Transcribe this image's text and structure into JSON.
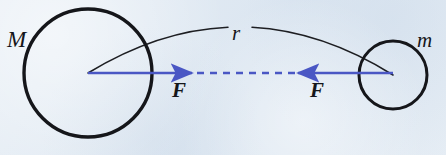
{
  "figure": {
    "kind": "physics-force-diagram",
    "width": 446,
    "height": 155,
    "background_color": "#dde7f1"
  },
  "colors": {
    "background": "#dde7f1",
    "ink": "#15161a",
    "force_arrow": "#4a57c4",
    "arc": "#1d1e22"
  },
  "bodies": [
    {
      "id": "large-mass",
      "label": "M",
      "label_x": 7,
      "label_y": 28,
      "center_x": 88,
      "center_y": 73,
      "radius": 64,
      "stroke_width": 3.4
    },
    {
      "id": "small-mass",
      "label": "m",
      "label_x": 417,
      "label_y": 30,
      "center_x": 393,
      "center_y": 75,
      "radius": 34,
      "stroke_width": 3.0
    }
  ],
  "separation": {
    "id": "separation-arc",
    "label": "r",
    "label_x": 232,
    "label_y": 23,
    "from_x": 88,
    "from_y": 73,
    "to_x": 393,
    "to_y": 75,
    "apex_y": 27,
    "stroke_width": 1.5,
    "gap_start_x": 228,
    "gap_end_x": 252
  },
  "forces": [
    {
      "id": "force-on-M",
      "label": "F",
      "label_x": 172,
      "label_y": 80,
      "direction": "right",
      "tail_x": 88,
      "tip_x": 192,
      "y": 73,
      "stroke_width": 2.6
    },
    {
      "id": "force-on-m",
      "label": "F",
      "label_x": 310,
      "label_y": 80,
      "direction": "left",
      "tail_x": 393,
      "tip_x": 298,
      "y": 73,
      "stroke_width": 2.6
    }
  ],
  "connector": {
    "id": "dashed-connector",
    "from_x": 197,
    "to_x": 296,
    "y": 73,
    "stroke_width": 2.6,
    "dash_pattern": "7 6"
  }
}
